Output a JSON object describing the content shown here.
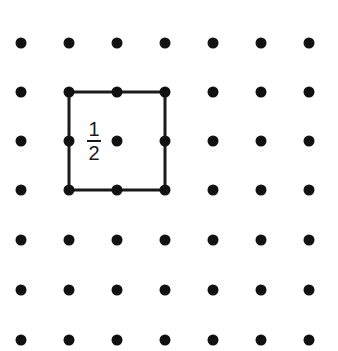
{
  "diagram": {
    "type": "dot-grid-geoboard",
    "grid": {
      "columns": 7,
      "rows": 7,
      "x_positions": [
        21,
        69,
        117,
        165,
        213,
        261,
        309
      ],
      "y_positions": [
        43,
        92,
        141,
        190,
        240,
        290,
        340
      ],
      "dot_radius": 5.5,
      "dot_color": "#111111"
    },
    "shape": {
      "kind": "square",
      "corners_grid": [
        [
          1,
          1
        ],
        [
          3,
          1
        ],
        [
          3,
          3
        ],
        [
          1,
          3
        ]
      ],
      "stroke_color": "#1a1a1a",
      "stroke_width": 3
    },
    "label": {
      "numerator": "1",
      "denominator": "2",
      "text": "1/2"
    }
  }
}
